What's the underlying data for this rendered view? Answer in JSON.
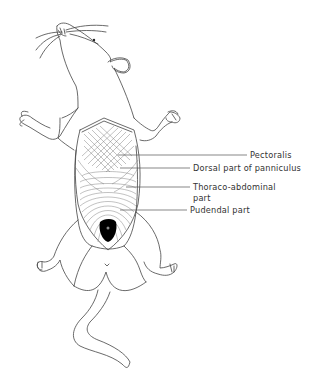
{
  "figure": {
    "labels": [
      {
        "id": "pectoralis",
        "text": "Pectoralis"
      },
      {
        "id": "dorsal",
        "text": "Dorsal part of panniculus"
      },
      {
        "id": "thoraco_line1",
        "text": "Thoraco-abdominal"
      },
      {
        "id": "thoraco_line2",
        "text": "part"
      },
      {
        "id": "pudendal",
        "text": "Pudendal part"
      }
    ]
  },
  "colors": {
    "line": "#444444",
    "text": "#333333",
    "fill_dark": "#000000",
    "background": "#ffffff"
  }
}
